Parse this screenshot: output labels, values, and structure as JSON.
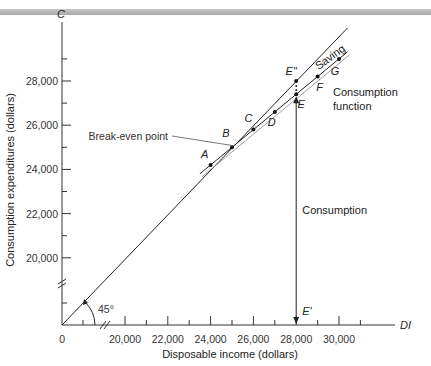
{
  "chart_data": {
    "type": "line",
    "title": "",
    "xlabel": "Disposable income (dollars)",
    "ylabel": "Consumption expenditures (dollars)",
    "x_axis_symbol": "DI",
    "y_axis_symbol": "C",
    "origin_label": "0",
    "xlim": [
      19000,
      31000
    ],
    "ylim": [
      19000,
      29800
    ],
    "x_ticks": [
      20000,
      22000,
      24000,
      26000,
      28000,
      30000
    ],
    "x_tick_labels": [
      "20,000",
      "22,000",
      "24,000",
      "26,000",
      "28,000",
      "30,000"
    ],
    "x_minor_ticks": [
      21000,
      23000,
      25000,
      27000,
      29000,
      31000
    ],
    "y_ticks": [
      20000,
      22000,
      24000,
      26000,
      28000
    ],
    "y_tick_labels": [
      "20,000",
      "22,000",
      "24,000",
      "26,000",
      "28,000"
    ],
    "y_minor_ticks": [
      21000,
      23000,
      25000,
      27000,
      29000
    ],
    "axis_breaks": true,
    "grid": false,
    "series": [
      {
        "name": "45° line",
        "values": [
          [
            19000,
            19000
          ],
          [
            31000,
            31000
          ]
        ]
      },
      {
        "name": "Consumption function",
        "points": [
          {
            "label": "A",
            "x": 24000,
            "y": 24200
          },
          {
            "label": "B",
            "x": 25000,
            "y": 25000
          },
          {
            "label": "C",
            "x": 26000,
            "y": 25800
          },
          {
            "label": "D",
            "x": 27000,
            "y": 26600
          },
          {
            "label": "E",
            "x": 28000,
            "y": 27400
          },
          {
            "label": "F",
            "x": 29000,
            "y": 28200
          },
          {
            "label": "G",
            "x": 30000,
            "y": 29000
          }
        ]
      }
    ],
    "special_points": [
      {
        "label": "E''",
        "x": 28000,
        "y": 28000
      }
    ],
    "annotations": {
      "angle": "45°",
      "break_even": "Break-even point",
      "saving": "Saving",
      "consumption_function": [
        "Consumption",
        "function"
      ],
      "consumption_arrow": "Consumption",
      "e_prime": "E'"
    }
  }
}
